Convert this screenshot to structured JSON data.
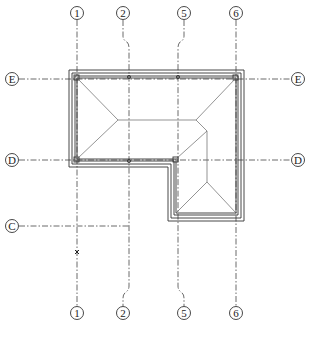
{
  "drawing": {
    "type": "roof plan",
    "colors": {
      "line": "#333333",
      "background": "#ffffff"
    }
  },
  "grid_columns": [
    {
      "label": "1",
      "top": [
        77,
        13
      ],
      "bottom": [
        77,
        313
      ]
    },
    {
      "label": "2",
      "top": [
        123,
        13
      ],
      "bottom": [
        123,
        313
      ]
    },
    {
      "label": "5",
      "top": [
        184,
        13
      ],
      "bottom": [
        184,
        313
      ]
    },
    {
      "label": "6",
      "top": [
        236,
        13
      ],
      "bottom": [
        236,
        313
      ]
    }
  ],
  "grid_rows": [
    {
      "label": "E",
      "left": [
        12,
        79
      ],
      "right": [
        298,
        79
      ]
    },
    {
      "label": "D",
      "left": [
        12,
        160
      ],
      "right": [
        298,
        160
      ]
    },
    {
      "label": "C",
      "left": [
        12,
        226
      ]
    }
  ],
  "markers": [
    {
      "type": "x-mark",
      "at": [
        77,
        252
      ]
    }
  ]
}
